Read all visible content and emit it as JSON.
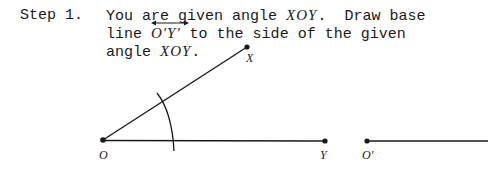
{
  "step": {
    "label": "Step 1.",
    "line1_pre": "You are given angle ",
    "line1_angle": "XOY",
    "line1_post": ".  Draw base",
    "line2_pre": "line ",
    "line2_ray": "O'Y'",
    "line2_post": " to the side of the given",
    "line3_pre": "angle ",
    "line3_angle": "XOY",
    "line3_post": "."
  },
  "figure": {
    "points": {
      "O": {
        "label": "O",
        "x": 103,
        "y": 140
      },
      "X": {
        "label": "X",
        "x": 247,
        "y": 47
      },
      "Y": {
        "label": "Y",
        "x": 325,
        "y": 141
      },
      "O_prime": {
        "label": "O'",
        "x": 367,
        "y": 141
      }
    },
    "line_color": "#1a1a1a"
  }
}
